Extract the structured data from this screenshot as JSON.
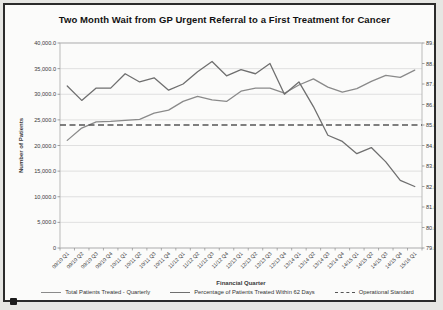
{
  "chart": {
    "title": "Two Month Wait from GP Urgent Referral to a First Treatment for Cancer",
    "x_axis_title": "Financial Quarter",
    "y_left_title": "Number of Patients",
    "y_right_title": "Performance",
    "legend": [
      {
        "label": "Total Patients Treated - Quarterly",
        "style": "solid",
        "color": "#8a8a8a"
      },
      {
        "label": "Percentage of Patients Treated Within 62 Days",
        "style": "solid",
        "color": "#6f6f6f"
      },
      {
        "label": "Operational Standard",
        "style": "dashed",
        "color": "#555555"
      }
    ]
  },
  "chart_data": {
    "type": "line",
    "title": "Two Month Wait from GP Urgent Referral to a First Treatment for Cancer",
    "xlabel": "Financial Quarter",
    "ylabel_left": "Number of Patients",
    "ylabel_right": "Performance",
    "grid": true,
    "legend_position": "bottom",
    "categories": [
      "09/10 Q1",
      "09/10 Q2",
      "09/10 Q3",
      "09/10 Q4",
      "10/11 Q1",
      "10/11 Q2",
      "10/11 Q3",
      "10/11 Q4",
      "11/12 Q1",
      "11/12 Q2",
      "11/12 Q3",
      "11/12 Q4",
      "12/13 Q1",
      "12/13 Q2",
      "12/13 Q3",
      "12/13 Q4",
      "13/14 Q1",
      "13/14 Q2",
      "13/14 Q3",
      "13/14 Q4",
      "14/15 Q1",
      "14/15 Q2",
      "14/15 Q3",
      "14/15 Q4",
      "15/16 Q1"
    ],
    "y_left": {
      "min": 0,
      "max": 40000,
      "ticks": [
        40000,
        35000,
        30000,
        25000,
        20000,
        15000,
        10000,
        5000,
        0
      ],
      "tick_labels": [
        "40,000.0",
        "35,000.0",
        "30,000.0",
        "25,000.0",
        "20,000.0",
        "15,000.0",
        "10,000.0",
        "5,000.0",
        "0"
      ]
    },
    "y_right": {
      "min": 79,
      "max": 89,
      "ticks": [
        89,
        88,
        87,
        86,
        85,
        84,
        83,
        82,
        81,
        80,
        79
      ],
      "tick_labels": [
        "89.0%",
        "88.0%",
        "87.0%",
        "86.0%",
        "85.0%",
        "84.0%",
        "83.0%",
        "82.0%",
        "81.0%",
        "80.0%",
        "79.0%"
      ]
    },
    "series": [
      {
        "name": "Total Patients Treated - Quarterly",
        "axis": "left",
        "color": "#8a8a8a",
        "values": [
          21000,
          23400,
          24600,
          24700,
          24900,
          25100,
          26300,
          26900,
          28600,
          29600,
          28900,
          28600,
          30600,
          31200,
          31200,
          30200,
          31800,
          33000,
          31400,
          30400,
          31100,
          32500,
          33700,
          33300,
          34700
        ]
      },
      {
        "name": "Percentage of Patients Treated Within 62 Days",
        "axis": "right",
        "color": "#6f6f6f",
        "values": [
          86.9,
          86.2,
          86.8,
          86.8,
          87.5,
          87.1,
          87.3,
          86.7,
          87.0,
          87.6,
          88.1,
          87.4,
          87.7,
          87.5,
          88.0,
          86.5,
          87.1,
          85.9,
          84.5,
          84.2,
          83.6,
          83.9,
          83.2,
          82.3,
          82.0
        ]
      },
      {
        "name": "Operational Standard",
        "axis": "right",
        "style": "dashed",
        "color": "#555555",
        "value": 85.0
      }
    ]
  }
}
